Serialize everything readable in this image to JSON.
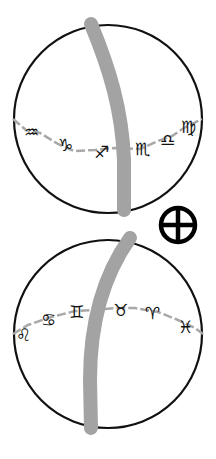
{
  "diagram": {
    "colors": {
      "circle_stroke": "#111111",
      "band": "#a3a3a3",
      "ecliptic_line": "#a8a8a8",
      "glyph": "#111111",
      "earth_symbol": "#000000",
      "background": "#ffffff"
    },
    "top_sphere": {
      "signs": [
        {
          "name": "Aquarius",
          "glyph": "♒"
        },
        {
          "name": "Capricorn",
          "glyph": "♑"
        },
        {
          "name": "Sagittarius",
          "glyph": "♐"
        },
        {
          "name": "Scorpio",
          "glyph": "♏"
        },
        {
          "name": "Libra",
          "glyph": "♎"
        },
        {
          "name": "Virgo",
          "glyph": "♍"
        }
      ]
    },
    "earth_symbol": {
      "name": "Earth",
      "glyph": "⊕"
    },
    "bottom_sphere": {
      "signs": [
        {
          "name": "Leo",
          "glyph": "♌"
        },
        {
          "name": "Cancer",
          "glyph": "♋"
        },
        {
          "name": "Gemini",
          "glyph": "♊"
        },
        {
          "name": "Taurus",
          "glyph": "♉"
        },
        {
          "name": "Aries",
          "glyph": "♈"
        },
        {
          "name": "Pisces",
          "glyph": "♓"
        }
      ]
    }
  }
}
